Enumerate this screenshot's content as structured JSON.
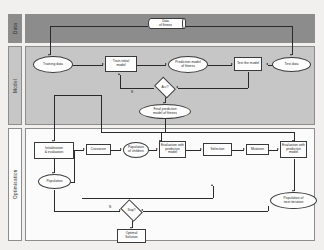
{
  "diagram": {
    "bands": [
      {
        "id": "data",
        "label": "Data",
        "fill": "#8c8c8c"
      },
      {
        "id": "model",
        "label": "Model",
        "fill": "#c6c6c6"
      },
      {
        "id": "optimisation",
        "label": "Optimisation",
        "fill": "#fbfbfb"
      }
    ],
    "nodes": {
      "data_of_fitness": "Data\nof fitness",
      "training_data": "Training data",
      "train_initial_model": "Train initial\nmodel",
      "prediction_model_of_fitness": "Prediction model\nof fitness",
      "test_the_model": "Test the model",
      "test_data": "Test data",
      "decision_accuracy": "Acc?",
      "final_prediction_model": "Final prediction\nmodel of fitness",
      "initialisation_evaluation": "Initialisation\n& evaluation",
      "crossover": "Crossover",
      "population_of_children": "Population\nof children",
      "evaluation_children": "Evaluation with\npredictive model",
      "selection": "Selection",
      "mutation": "Mutation",
      "evaluation_mutated": "Evaluation with\npredictive model",
      "population": "Population",
      "population_next_iteration": "Population of\nnext iteration",
      "decision_stop": "Stop?",
      "optimal_solution": "Optimal\nSolution"
    },
    "edge_labels": {
      "acc_no": "N",
      "acc_yes": "Y",
      "stop_no": "N",
      "stop_yes": "Y"
    },
    "colors": {
      "band_data": "#8c8c8c",
      "band_model": "#c6c6c6",
      "band_optimisation": "#fbfbfb",
      "node_fill": "#fdfdfd",
      "stroke": "#3a3a3a",
      "page_background": "#f2f0ee"
    }
  }
}
